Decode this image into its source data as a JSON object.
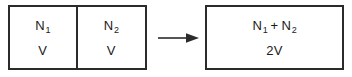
{
  "figure": {
    "background_color": "#ffffff",
    "line_color": "#2b2b2b",
    "text_color": "#1a1a1a"
  },
  "left_system": {
    "compartments": [
      {
        "name": "compartment-1",
        "particle_symbol": "N",
        "particle_subscript": "1",
        "volume_label": "V"
      },
      {
        "name": "compartment-2",
        "particle_symbol": "N",
        "particle_subscript": "2",
        "volume_label": "V"
      }
    ]
  },
  "arrow": {
    "icon": "right-arrow-icon",
    "direction": "right"
  },
  "right_system": {
    "particle_symbol_1": "N",
    "particle_subscript_1": "1",
    "operator": "+",
    "particle_symbol_2": "N",
    "particle_subscript_2": "2",
    "volume_label": "2V"
  }
}
